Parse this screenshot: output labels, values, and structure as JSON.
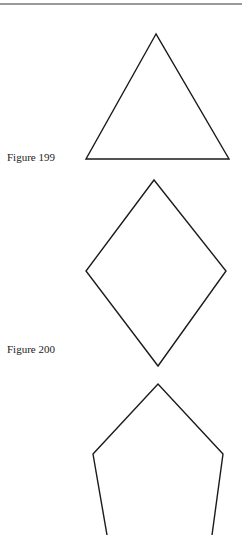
{
  "figures": [
    {
      "label": "Figure 199",
      "shape": "triangle",
      "points": "156,34 86,159 229,159"
    },
    {
      "label": "Figure 200",
      "shape": "rhombus",
      "points": "154,180 226,271 158,366 86,271"
    },
    {
      "shape": "pentagon-partial",
      "points": "107,535 93,454 158,384 223,454 212,535"
    }
  ],
  "colors": {
    "stroke": "#1a1a1a",
    "rule": "#9a9a9a"
  }
}
